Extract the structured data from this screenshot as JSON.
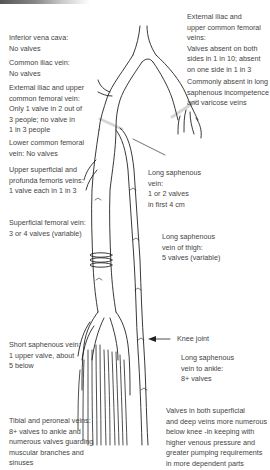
{
  "diagram": {
    "labels_left": [
      {
        "id": "ivc",
        "title": "Inferior vena cava:",
        "lines": [
          "No valves"
        ]
      },
      {
        "id": "common-iliac",
        "title": "Common iliac vein:",
        "lines": [
          "No valves"
        ]
      },
      {
        "id": "ext-iliac-left",
        "title": "External iliac and upper",
        "lines": [
          "common femoral vein:",
          "Only 1 valve in 2 out of",
          "3 people; no valve in",
          "1 in 3 people"
        ]
      },
      {
        "id": "lower-common-femoral",
        "title": "Lower common femoral",
        "lines": [
          "vein:  No valves"
        ]
      },
      {
        "id": "upper-superficial",
        "title": "Upper superficial and",
        "lines": [
          "profunda femoris veins:",
          "1 valve each in 1 in 3"
        ]
      },
      {
        "id": "superficial-femoral",
        "title": "Superficial femoral vein:",
        "lines": [
          "3 or 4 valves (variable)"
        ]
      },
      {
        "id": "short-saphenous",
        "title": "Short saphenous vein:",
        "lines": [
          "1 upper valve, about",
          "5 below"
        ]
      },
      {
        "id": "tibial-peroneal",
        "title": "Tibial and peroneal veins:",
        "lines": [
          "8+ valves to ankle and",
          "numerous valves guarding",
          "muscular branches and",
          "sinuses"
        ]
      }
    ],
    "labels_right": [
      {
        "id": "ext-iliac-right",
        "title": "External iliac and",
        "lines": [
          "upper common femoral",
          "veins:",
          "Valves absent on both",
          "sides in 1 in 10; absent",
          "on one side in 1 in 3"
        ]
      },
      {
        "id": "commonly-absent",
        "title": "Commonly absent in long",
        "lines": [
          "saphenous incompetence",
          "and varicose veins"
        ]
      },
      {
        "id": "long-saph-upper",
        "title": "Long saphenous",
        "lines": [
          "vein:",
          "1 or 2 valves",
          "in first 4 cm"
        ]
      },
      {
        "id": "long-saph-thigh",
        "title": "Long saphenous",
        "lines": [
          "vein of thigh:",
          "5 valves (variable)"
        ]
      },
      {
        "id": "knee-joint",
        "title": "Knee joint",
        "lines": []
      },
      {
        "id": "long-saph-ankle",
        "title": "Long saphenous",
        "lines": [
          "vein to ankle:",
          "8+ valves"
        ]
      },
      {
        "id": "summary",
        "title": "Valves in both superficial",
        "lines": [
          "and deep veins more numerous",
          "below knee -in keeping with",
          "higher venous pressure and",
          "greater pumping requirements",
          "in more dependent parts"
        ]
      }
    ],
    "colors": {
      "line": "#222222",
      "text": "#444444",
      "highlight_band": "#d8d8d8"
    }
  }
}
